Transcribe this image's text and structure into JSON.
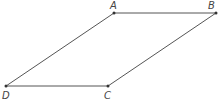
{
  "diagram": {
    "type": "parallelogram",
    "stroke_color": "#555555",
    "points": [
      {
        "name": "A",
        "x": 114,
        "y": 13,
        "lx": 110,
        "ly": 9
      },
      {
        "name": "B",
        "x": 216,
        "y": 13,
        "lx": 208,
        "ly": 9
      },
      {
        "name": "C",
        "x": 108,
        "y": 86,
        "lx": 104,
        "ly": 99
      },
      {
        "name": "D",
        "x": 6,
        "y": 86,
        "lx": 2,
        "ly": 99
      }
    ],
    "segments": [
      [
        "A",
        "B"
      ],
      [
        "B",
        "C"
      ],
      [
        "C",
        "D"
      ],
      [
        "D",
        "A"
      ]
    ]
  }
}
